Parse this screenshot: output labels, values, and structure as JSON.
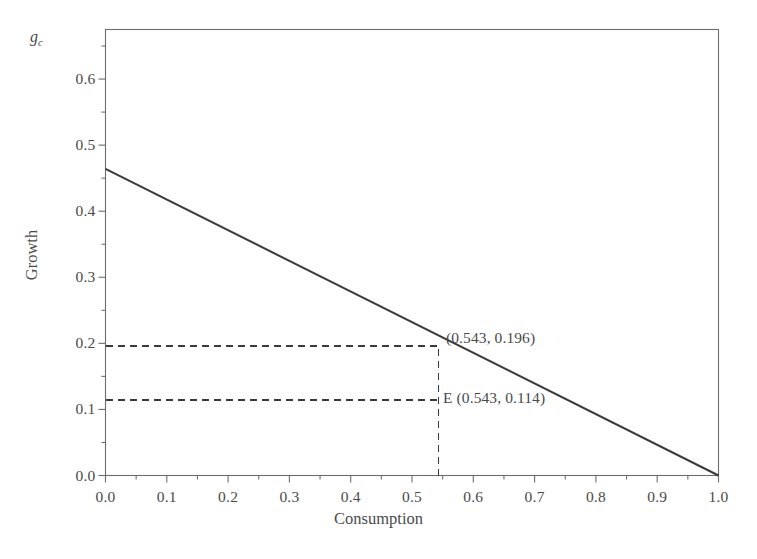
{
  "figure": {
    "width": 757,
    "height": 559,
    "background": "#ffffff",
    "ink_color": "#3a3a3a",
    "corner_symbol_base": "g",
    "corner_symbol_sub": "c"
  },
  "chart_data": {
    "type": "line",
    "title": "",
    "subtitle": "",
    "xlabel": "Consumption",
    "ylabel": "Growth",
    "corner_label": "g_c",
    "xlim": [
      0.0,
      1.0
    ],
    "ylim": [
      0.0,
      0.675
    ],
    "grid": false,
    "legend": null,
    "xticks": [
      0.0,
      0.1,
      0.2,
      0.3,
      0.4,
      0.5,
      0.6,
      0.7,
      0.8,
      0.9,
      1.0
    ],
    "xticklabels": [
      "0.0",
      "0.1",
      "0.2",
      "0.3",
      "0.4",
      "0.5",
      "0.6",
      "0.7",
      "0.8",
      "0.9",
      "1.0"
    ],
    "xminorticks": [
      0.05,
      0.15,
      0.25,
      0.35,
      0.45,
      0.55,
      0.65,
      0.75,
      0.85,
      0.95
    ],
    "yticks": [
      0.0,
      0.1,
      0.2,
      0.3,
      0.4,
      0.5,
      0.6
    ],
    "yticklabels": [
      "0.0",
      "0.1",
      "0.2",
      "0.3",
      "0.4",
      "0.5",
      "0.6"
    ],
    "yminorticks": [
      0.05,
      0.15,
      0.25,
      0.35,
      0.45,
      0.55,
      0.65
    ],
    "series": [
      {
        "name": "growth-consumption-frontier",
        "style": "solid",
        "color": "#3a3a3a",
        "width": 2.0,
        "x": [
          0.0,
          1.0
        ],
        "y": [
          0.464,
          0.0
        ]
      }
    ],
    "guides": [
      {
        "name": "horizontal-guide-upper",
        "style": "dashed",
        "from": [
          0.0,
          0.196
        ],
        "to": [
          0.543,
          0.196
        ]
      },
      {
        "name": "horizontal-guide-lower",
        "style": "dashed",
        "from": [
          0.0,
          0.114
        ],
        "to": [
          0.543,
          0.114
        ]
      },
      {
        "name": "vertical-guide",
        "style": "dashed",
        "from": [
          0.543,
          0.0
        ],
        "to": [
          0.543,
          0.196
        ]
      }
    ],
    "annotations": [
      {
        "name": "point-label-upper",
        "text": "(0.543, 0.196)",
        "x": 0.543,
        "y": 0.196
      },
      {
        "name": "point-label-equilibrium",
        "text": "E (0.543, 0.114)",
        "x": 0.543,
        "y": 0.114
      }
    ]
  },
  "caption": ""
}
